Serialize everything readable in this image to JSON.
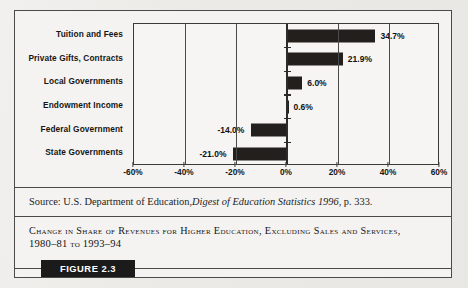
{
  "figure": {
    "badge_label": "FIGURE 2.3",
    "source_prefix": "Source: U.S. Department of Education, ",
    "source_title": "Digest of Education Statistics 1996",
    "source_suffix": ", p. 333.",
    "caption_line1": "Change in Share of Revenues for Higher Education, Excluding Sales and Services,",
    "caption_line2_year1": "1980–81",
    "caption_line2_to": "to",
    "caption_line2_year2": "1993–94"
  },
  "chart_data": {
    "type": "bar",
    "orientation": "horizontal",
    "title": "Change in Share of Revenues for Higher Education, Excluding Sales and Services, 1980–81 to 1993–94",
    "xlabel": "",
    "ylabel": "",
    "xlim": [
      -60,
      60
    ],
    "grid": false,
    "zero_axis": true,
    "categories": [
      "Tuition and Fees",
      "Private Gifts, Contracts",
      "Local Governments",
      "Endowment Income",
      "Federal Government",
      "State Governments"
    ],
    "values": [
      34.7,
      21.9,
      6.0,
      0.6,
      -14.0,
      -21.0
    ],
    "value_labels": [
      "34.7%",
      "21.9%",
      "6.0%",
      "0.6%",
      "-14.0%",
      "-21.0%"
    ],
    "xticks": [
      -60,
      -40,
      -20,
      0,
      20,
      40,
      60
    ],
    "xtick_labels": [
      "-60%",
      "-40%",
      "-20%",
      "0%",
      "20%",
      "40%",
      "60%"
    ],
    "bar_color": "#231f1c"
  }
}
